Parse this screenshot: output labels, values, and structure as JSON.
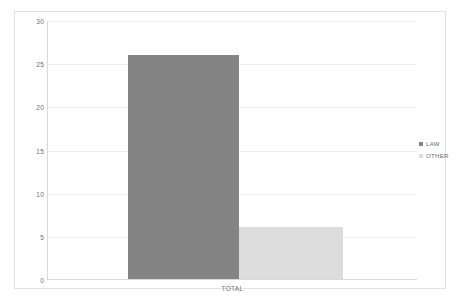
{
  "chart_data": {
    "type": "bar",
    "title": "",
    "xlabel": "TOTAL",
    "ylabel": "",
    "categories": [
      "TOTAL"
    ],
    "series": [
      {
        "name": "LAW",
        "values": [
          26
        ],
        "color": "#848484"
      },
      {
        "name": "OTHER",
        "values": [
          6
        ],
        "color": "#dcdcdc"
      }
    ],
    "ylim": [
      0,
      30
    ],
    "yticks": [
      0,
      5,
      10,
      15,
      20,
      25,
      30
    ],
    "ytick_labels": [
      "0",
      "5",
      "10",
      "15",
      "20",
      "25",
      "30"
    ],
    "grid": true,
    "legend_position": "right",
    "legend_entries": [
      "LAW",
      "OTHER"
    ],
    "orientation": "vertical",
    "bar_layout": "clustered"
  },
  "axis": {
    "y_labels": [
      "30",
      "25",
      "20",
      "15",
      "10",
      "5",
      "0"
    ],
    "x_label": "TOTAL"
  },
  "legend": {
    "items": [
      {
        "label": "LAW",
        "color": "#848484"
      },
      {
        "label": "OTHER",
        "color": "#dcdcdc"
      }
    ]
  }
}
